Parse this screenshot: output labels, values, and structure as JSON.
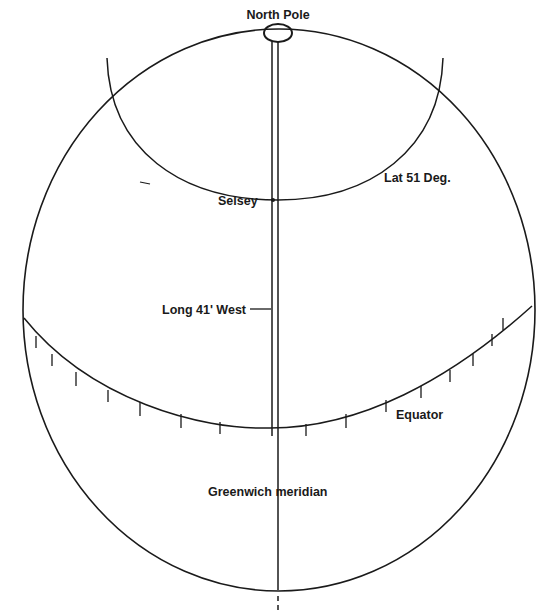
{
  "diagram": {
    "labels": {
      "north_pole": "North Pole",
      "selsey": "Selsey",
      "latitude": "Lat 51 Deg.",
      "longitude": "Long 41' West",
      "equator": "Equator",
      "greenwich": "Greenwich meridian"
    },
    "colors": {
      "line": "#1a1a1a",
      "background": "#ffffff"
    }
  }
}
